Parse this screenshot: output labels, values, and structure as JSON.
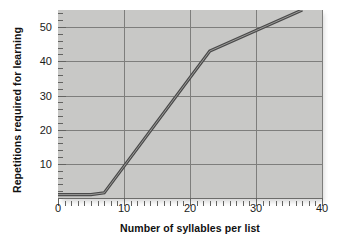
{
  "chart_data": {
    "type": "line",
    "title": "",
    "xlabel": "Number of syllables per list",
    "ylabel": "Repetitions required for learning",
    "xlim": [
      0,
      40
    ],
    "ylim": [
      0,
      55
    ],
    "xticks": [
      0,
      10,
      20,
      30,
      40
    ],
    "yticks": [
      10,
      20,
      30,
      40,
      50
    ],
    "grid": true,
    "legend": "none",
    "x": [
      0,
      5,
      7,
      23,
      37
    ],
    "values": [
      1,
      1,
      1.5,
      43,
      55
    ],
    "series": [
      {
        "name": "Repetitions required for learning",
        "color": "#4a4a4a",
        "points": [
          {
            "x": 0,
            "y": 1
          },
          {
            "x": 5,
            "y": 1
          },
          {
            "x": 7,
            "y": 1.5
          },
          {
            "x": 23,
            "y": 43
          },
          {
            "x": 37,
            "y": 55
          }
        ]
      }
    ],
    "annotations": [],
    "minor_tick_interval_x": 1,
    "minor_tick_interval_y": 2
  },
  "axes": {
    "x_tick_labels": [
      "0",
      "10",
      "20",
      "30",
      "40"
    ],
    "y_tick_labels": [
      "10",
      "20",
      "30",
      "40",
      "50"
    ],
    "x_title": "Number of syllables per list",
    "y_title": "Repetitions required for learning"
  },
  "style": {
    "panel_background": "#c8c8c6",
    "gridline_color": "#7e7e7c",
    "line_color": "#4a4a4a",
    "line_highlight": "#8f8f8f",
    "text_color": "#101010",
    "page_background": "#ffffff"
  }
}
